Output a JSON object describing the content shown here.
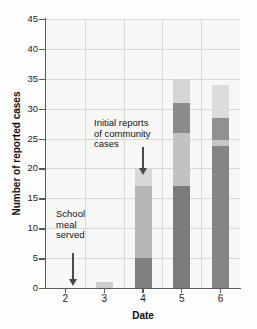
{
  "chart_data": {
    "type": "bar",
    "stacked": true,
    "title": "",
    "xlabel": "Date",
    "ylabel": "Number of reported cases",
    "categories": [
      "2",
      "3",
      "4",
      "5",
      "6"
    ],
    "x": [
      2,
      3,
      4,
      5,
      6
    ],
    "ylim": [
      0,
      45
    ],
    "yticks": [
      0,
      5,
      10,
      15,
      20,
      25,
      30,
      35,
      40,
      45
    ],
    "ytick_labels": [
      "0",
      "5",
      "10",
      "15",
      "20",
      "25",
      "30",
      "35",
      "40",
      "45"
    ],
    "xtick_labels": [
      "2",
      "3",
      "4",
      "5",
      "6"
    ],
    "grid": "both",
    "legend": "none",
    "totals": [
      0,
      1,
      20,
      35,
      34
    ],
    "series": [
      {
        "name": "segment-1-dark",
        "color": "#808080",
        "values": [
          0,
          0,
          5,
          17,
          24
        ]
      },
      {
        "name": "segment-2-light",
        "color": "#c9c9c9",
        "values": [
          0,
          1,
          12,
          9,
          1
        ]
      },
      {
        "name": "segment-3-medium",
        "color": "#9a9a9a",
        "values": [
          0,
          0,
          0,
          5,
          4
        ]
      },
      {
        "name": "segment-4-pale",
        "color": "#d6d6d6",
        "values": [
          0,
          0,
          3,
          4,
          5
        ]
      }
    ],
    "stack_order": [
      "segment-1-dark",
      "segment-2-light",
      "segment-3-medium",
      "segment-4-pale"
    ],
    "bars": [
      {
        "category": "2",
        "total": 0,
        "segments": []
      },
      {
        "category": "3",
        "total": 1,
        "segments": [
          {
            "from": 0,
            "to": 1,
            "color": "#cccccc"
          }
        ]
      },
      {
        "category": "4",
        "total": 20,
        "segments": [
          {
            "from": 0,
            "to": 5,
            "color": "#7f7f7f"
          },
          {
            "from": 5,
            "to": 17,
            "color": "#b5b5b5"
          },
          {
            "from": 17,
            "to": 20,
            "color": "#d8d8d8"
          }
        ]
      },
      {
        "category": "5",
        "total": 35,
        "segments": [
          {
            "from": 0,
            "to": 17,
            "color": "#7b7b7b"
          },
          {
            "from": 17,
            "to": 26,
            "color": "#c2c2c2"
          },
          {
            "from": 26,
            "to": 31,
            "color": "#8c8c8c"
          },
          {
            "from": 31,
            "to": 35,
            "color": "#d5d5d5"
          }
        ]
      },
      {
        "category": "6",
        "total": 34,
        "segments": [
          {
            "from": 0,
            "to": 23.8,
            "color": "#858585"
          },
          {
            "from": 23.8,
            "to": 24.8,
            "color": "#c6c6c6"
          },
          {
            "from": 24.8,
            "to": 28.5,
            "color": "#919191"
          },
          {
            "from": 28.5,
            "to": 34,
            "color": "#dcdcdc"
          }
        ]
      }
    ],
    "annotations": [
      {
        "name": "school-meal-served",
        "lines": [
          "School",
          "meal",
          "served"
        ],
        "text": "School meal served",
        "points_to_category": "2",
        "arrow": "down"
      },
      {
        "name": "initial-reports-community-cases",
        "lines": [
          "Initial reports",
          "of community",
          "cases"
        ],
        "text": "Initial reports of community cases",
        "points_to_category": "4",
        "arrow": "down"
      }
    ],
    "colors": {
      "plot_background": "#f7f7f5",
      "grid": "#d8d8d4",
      "axis": "#5a5a5a",
      "text": "#1b1b1b",
      "arrow": "#4a4a4a"
    }
  }
}
